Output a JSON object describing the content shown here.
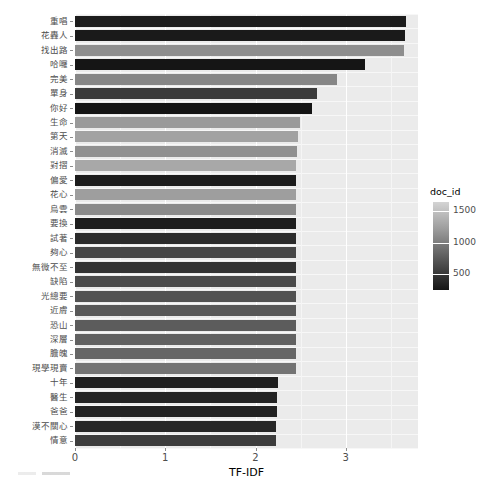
{
  "chart_data": {
    "type": "bar",
    "orientation": "horizontal",
    "title": "",
    "xlabel": "TF-IDF",
    "ylabel": "",
    "xlim": [
      0,
      3.8
    ],
    "xticks": [
      0,
      1,
      2,
      3
    ],
    "xticklabels": [
      "0",
      "1",
      "2",
      "3"
    ],
    "grid": true,
    "legend": {
      "title": "doc_id",
      "type": "continuous-colorbar",
      "position": "right",
      "ticks": [
        1500,
        1000,
        500
      ],
      "ticklabels": [
        "1500",
        "1000",
        "500"
      ],
      "low_color": "#151515",
      "high_color": "#d4d4d4"
    },
    "categories": [
      "重唱",
      "花轟人",
      "找出路",
      "哈囉",
      "完美",
      "單身",
      "你好",
      "生命",
      "第天",
      "消滅",
      "對摺",
      "偏愛",
      "花心",
      "烏雲",
      "要換",
      "試著",
      "夠心",
      "無微不至",
      "缺陷",
      "光總要",
      "近膚",
      "恐山",
      "深層",
      "膽魄",
      "現學現賣",
      "十年",
      "醫生",
      "爸爸",
      "漠不關心",
      "情意"
    ],
    "values": [
      3.67,
      3.66,
      3.64,
      3.21,
      2.9,
      2.68,
      2.63,
      2.49,
      2.47,
      2.46,
      2.45,
      2.45,
      2.45,
      2.45,
      2.45,
      2.45,
      2.45,
      2.45,
      2.45,
      2.45,
      2.45,
      2.45,
      2.45,
      2.45,
      2.45,
      2.25,
      2.24,
      2.24,
      2.23,
      2.23
    ],
    "doc_id": [
      250,
      300,
      1250,
      200,
      1150,
      620,
      180,
      1300,
      1400,
      1200,
      1450,
      230,
      1350,
      1150,
      260,
      400,
      700,
      480,
      750,
      820,
      880,
      900,
      950,
      1000,
      1100,
      300,
      350,
      330,
      380,
      640
    ],
    "bar_colors": [
      "#1c1c1c",
      "#1a1a1a",
      "#8e8e8e",
      "#151515",
      "#868686",
      "#3b3b3b",
      "#141414",
      "#9a9a9a",
      "#a2a2a2",
      "#909090",
      "#a8a8a8",
      "#1b1b1b",
      "#9e9e9e",
      "#8a8a8a",
      "#1d1d1d",
      "#2b2b2b",
      "#464646",
      "#333333",
      "#4b4b4b",
      "#525252",
      "#585858",
      "#5c5c5c",
      "#616161",
      "#666666",
      "#737373",
      "#1f1f1f",
      "#242424",
      "#222222",
      "#272727",
      "#3d3d3d"
    ]
  },
  "axis": {
    "x_title": "TF-IDF"
  }
}
